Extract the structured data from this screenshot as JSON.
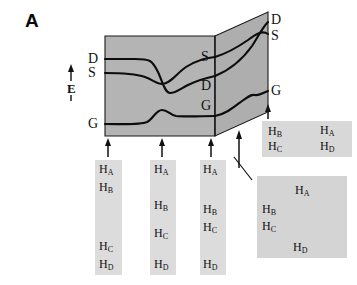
{
  "figure": {
    "panel_label": "A",
    "colors": {
      "surface_fill": "#b3b3b3",
      "surface_fill_right": "#acacac",
      "gel_fill": "#dcdcdc",
      "gel_fill_2d": "#d4d4d4",
      "line": "#000000",
      "text": "#111111",
      "background": "#ffffff"
    }
  },
  "energy_axis": {
    "label": "E",
    "arrow_icon": "up-arrow-icon",
    "tick_icon": "axis-tick-icon"
  },
  "landscape": {
    "front_face_labels": [
      {
        "text": "D",
        "x": 88,
        "y": 58
      },
      {
        "text": "S",
        "x": 88,
        "y": 72
      },
      {
        "text": "G",
        "x": 88,
        "y": 122
      }
    ],
    "back_edge_labels": [
      {
        "text": "S",
        "x": 200,
        "y": 55
      },
      {
        "text": "D",
        "x": 200,
        "y": 84
      },
      {
        "text": "G",
        "x": 200,
        "y": 103
      }
    ],
    "right_face_labels": [
      {
        "text": "D",
        "x": 270,
        "y": 17
      },
      {
        "text": "S",
        "x": 270,
        "y": 33
      },
      {
        "text": "G",
        "x": 270,
        "y": 88
      }
    ],
    "state_names": {
      "D": "doublet state",
      "S": "singlet state",
      "G": "ground state"
    }
  },
  "gel_lanes": [
    {
      "name": "lane-1",
      "x": 95,
      "y": 160,
      "w": 27,
      "h": 115,
      "arrow": {
        "x": 108,
        "y_top": 138,
        "y_bottom": 157
      },
      "bands": [
        {
          "label": "H",
          "sub": "A",
          "x": 99,
          "y": 163
        },
        {
          "label": "H",
          "sub": "B",
          "x": 99,
          "y": 181
        },
        {
          "label": "H",
          "sub": "C",
          "x": 99,
          "y": 240
        },
        {
          "label": "H",
          "sub": "D",
          "x": 99,
          "y": 258
        }
      ]
    },
    {
      "name": "lane-2",
      "x": 150,
      "y": 160,
      "w": 26,
      "h": 115,
      "arrow": {
        "x": 162,
        "y_top": 138,
        "y_bottom": 157
      },
      "bands": [
        {
          "label": "H",
          "sub": "A",
          "x": 154,
          "y": 163
        },
        {
          "label": "H",
          "sub": "B",
          "x": 154,
          "y": 199
        },
        {
          "label": "H",
          "sub": "C",
          "x": 154,
          "y": 227
        },
        {
          "label": "H",
          "sub": "D",
          "x": 154,
          "y": 258
        }
      ]
    },
    {
      "name": "lane-3",
      "x": 200,
      "y": 160,
      "w": 26,
      "h": 115,
      "arrow": {
        "x": 211,
        "y_top": 138,
        "y_bottom": 157
      },
      "bands": [
        {
          "label": "H",
          "sub": "A",
          "x": 203,
          "y": 163
        },
        {
          "label": "H",
          "sub": "B",
          "x": 203,
          "y": 203
        },
        {
          "label": "H",
          "sub": "C",
          "x": 203,
          "y": 221
        },
        {
          "label": "H",
          "sub": "D",
          "x": 203,
          "y": 258
        }
      ]
    }
  ],
  "gel_2d": [
    {
      "name": "gel-2d-top",
      "x": 262,
      "y": 121,
      "w": 90,
      "h": 36,
      "arrow": {
        "x": 268,
        "y_top": 104,
        "y_bottom": 119
      },
      "bands": [
        {
          "label": "H",
          "sub": "B",
          "x": 268,
          "y": 125
        },
        {
          "label": "H",
          "sub": "A",
          "x": 320,
          "y": 124
        },
        {
          "label": "H",
          "sub": "C",
          "x": 268,
          "y": 140
        },
        {
          "label": "H",
          "sub": "D",
          "x": 320,
          "y": 140
        }
      ]
    },
    {
      "name": "gel-2d-bottom",
      "x": 257,
      "y": 176,
      "w": 90,
      "h": 82,
      "pointer": {
        "x1": 251,
        "y1": 179,
        "x2": 234,
        "y2": 157
      },
      "bands": [
        {
          "label": "H",
          "sub": "A",
          "x": 295,
          "y": 184
        },
        {
          "label": "H",
          "sub": "B",
          "x": 262,
          "y": 203
        },
        {
          "label": "H",
          "sub": "C",
          "x": 262,
          "y": 220
        },
        {
          "label": "H",
          "sub": "D",
          "x": 293,
          "y": 241
        }
      ]
    }
  ],
  "pointer_arrow": {
    "name": "landscape-pointer-arrow",
    "x": 239,
    "y_top": 130,
    "y_bottom": 168
  }
}
